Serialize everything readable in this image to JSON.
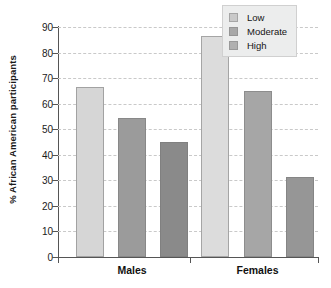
{
  "chart_data": {
    "type": "bar",
    "title": "",
    "xlabel": "",
    "ylabel": "% African American participants",
    "ylim": [
      0,
      90
    ],
    "yticks": [
      0,
      10,
      20,
      30,
      40,
      50,
      60,
      70,
      80,
      90
    ],
    "grid": true,
    "legend_position": "top-right",
    "categories": [
      "Males",
      "Females"
    ],
    "series": [
      {
        "name": "Low",
        "values": [
          66.5,
          86.5
        ],
        "color": "#d6d6d6"
      },
      {
        "name": "Moderate",
        "values": [
          54.5,
          65.0
        ],
        "color": "#9b9b9b"
      },
      {
        "name": "High",
        "values": [
          45.0,
          31.5
        ],
        "color": "#8a8a8a"
      }
    ]
  },
  "legend": {
    "items": [
      {
        "label": "Low",
        "color": "#c9c9c9"
      },
      {
        "label": "Moderate",
        "color": "#a8a8a8"
      },
      {
        "label": "High",
        "color": "#b0b0b0"
      }
    ]
  },
  "axes": {
    "y_title": "% African American participants",
    "y_tick_labels": [
      "90",
      "80",
      "70",
      "60",
      "50",
      "40",
      "30",
      "20",
      "10",
      "0"
    ],
    "x_group_labels": [
      "Males",
      "Females"
    ]
  }
}
